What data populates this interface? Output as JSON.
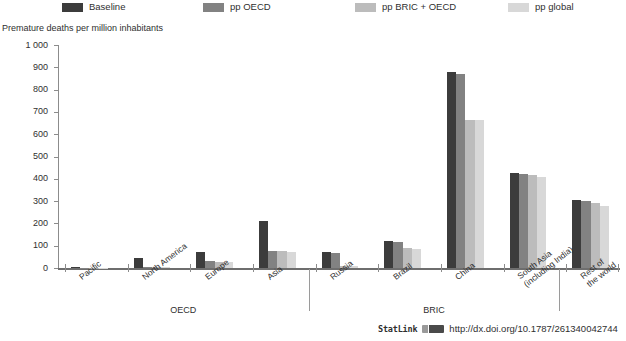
{
  "chart_data": {
    "type": "bar",
    "title": "",
    "ylabel": "Premature deaths per million inhabitants",
    "xlabel": "",
    "ylim": [
      0,
      1000
    ],
    "yticks": [
      "0",
      "100",
      "200",
      "300",
      "400",
      "500",
      "600",
      "700",
      "800",
      "900",
      "1 000"
    ],
    "grid": false,
    "legend_position": "top",
    "categories": [
      "Pacific",
      "North America",
      "Europe",
      "Asia",
      "Russia",
      "Brazil",
      "China",
      "South Asia (including India)",
      "Rest of the world"
    ],
    "category_labels": [
      {
        "line1": "Pacific",
        "line2": ""
      },
      {
        "line1": "North America",
        "line2": ""
      },
      {
        "line1": "Europe",
        "line2": ""
      },
      {
        "line1": "Asia",
        "line2": ""
      },
      {
        "line1": "Russia",
        "line2": ""
      },
      {
        "line1": "Brazil",
        "line2": ""
      },
      {
        "line1": "China",
        "line2": ""
      },
      {
        "line1": "South Asia",
        "line2": "(including India)"
      },
      {
        "line1": "Rest of",
        "line2": "the world"
      }
    ],
    "groups": [
      {
        "label": "OECD",
        "categories": [
          "Pacific",
          "North America",
          "Europe",
          "Asia"
        ]
      },
      {
        "label": "BRIC",
        "categories": [
          "Russia",
          "Brazil",
          "China",
          "South Asia (including India)"
        ]
      },
      {
        "label": "",
        "categories": [
          "Rest of the world"
        ]
      }
    ],
    "series": [
      {
        "name": "Baseline",
        "color": "#3c3c3c",
        "values": [
          3,
          43,
          70,
          210,
          72,
          120,
          880,
          425,
          305
        ]
      },
      {
        "name": "pp OECD",
        "color": "#828282",
        "values": [
          2,
          5,
          30,
          78,
          68,
          115,
          872,
          420,
          300
        ]
      },
      {
        "name": "pp BRIC + OECD",
        "color": "#bcbcbc",
        "values": [
          2,
          4,
          28,
          75,
          10,
          90,
          665,
          415,
          290
        ]
      },
      {
        "name": "pp global",
        "color": "#d8d8d8",
        "values": [
          2,
          3,
          26,
          72,
          8,
          85,
          662,
          410,
          280
        ]
      }
    ]
  },
  "legend": {
    "items": [
      {
        "label": "Baseline",
        "color": "#3c3c3c"
      },
      {
        "label": "pp OECD",
        "color": "#828282"
      },
      {
        "label": "pp BRIC + OECD",
        "color": "#bcbcbc"
      },
      {
        "label": "pp global",
        "color": "#d8d8d8"
      }
    ]
  },
  "footer": {
    "statlink_word": "StatLink",
    "url": "http://dx.doi.org/10.1787/261340042744"
  }
}
